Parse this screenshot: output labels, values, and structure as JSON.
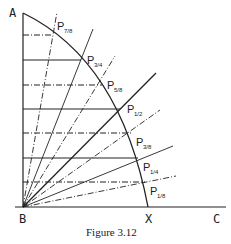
{
  "diagram": {
    "caption": "Figure 3.12",
    "points": {
      "A": "A",
      "B": "B",
      "X": "X",
      "C": "C"
    },
    "arc_points": [
      {
        "label": "P",
        "sub": "7/8",
        "x": 53,
        "y": 35,
        "style": "dashdot"
      },
      {
        "label": "P",
        "sub": "3/4",
        "x": 81,
        "y": 60,
        "style": "solid"
      },
      {
        "label": "P",
        "sub": "5/8",
        "x": 102,
        "y": 85,
        "style": "dashdot"
      },
      {
        "label": "P",
        "sub": "1/2",
        "x": 120,
        "y": 109,
        "style": "solid"
      },
      {
        "label": "P",
        "sub": "3/8",
        "x": 131,
        "y": 133,
        "style": "dashdot"
      },
      {
        "label": "P",
        "sub": "1/4",
        "x": 138,
        "y": 158,
        "style": "solid"
      },
      {
        "label": "P",
        "sub": "1/8",
        "x": 145,
        "y": 182,
        "style": "dashdot"
      }
    ]
  }
}
